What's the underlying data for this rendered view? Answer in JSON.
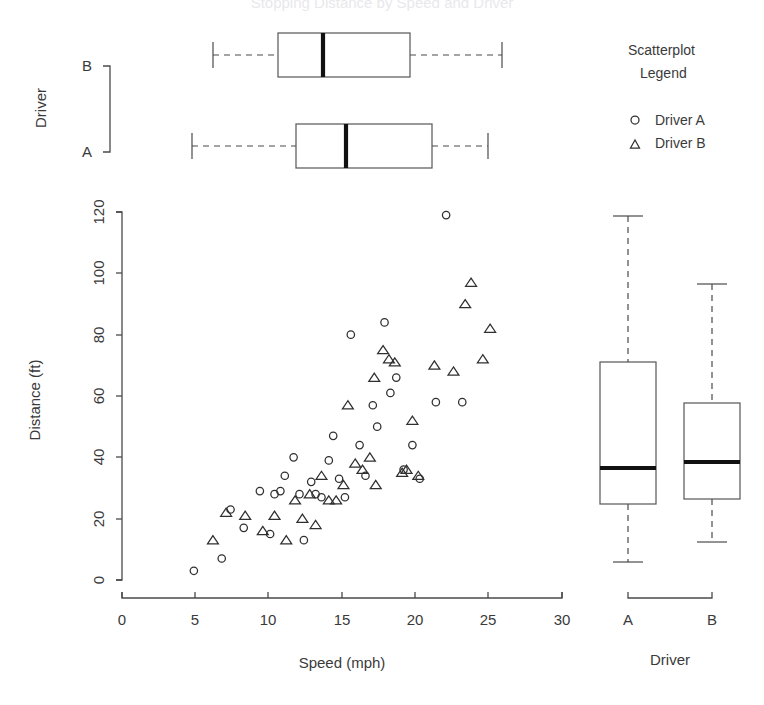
{
  "figure": {
    "clipped_title": "Stopping Distance by Speed and Driver"
  },
  "legend": {
    "title_line1": "Scatterplot",
    "title_line2": "Legend",
    "entries": [
      {
        "marker": "circle",
        "label": "Driver A"
      },
      {
        "marker": "triangle",
        "label": "Driver B"
      }
    ]
  },
  "top_panel": {
    "axis_title": "Driver",
    "category_labels": [
      "B",
      "A"
    ]
  },
  "main_panel": {
    "xlabel": "Speed (mph)",
    "ylabel": "Distance (ft)",
    "xticks": [
      0,
      5,
      10,
      15,
      20,
      25,
      30
    ],
    "yticks": [
      0,
      20,
      40,
      60,
      80,
      100,
      120
    ]
  },
  "right_panel": {
    "axis_title": "Driver",
    "category_labels": [
      "A",
      "B"
    ]
  },
  "chart_data": {
    "type": "scatter",
    "title": "Stopping Distance by Speed and Driver",
    "xlabel": "Speed (mph)",
    "ylabel": "Distance (ft)",
    "xlim": [
      0,
      30
    ],
    "ylim": [
      0,
      125
    ],
    "grid": false,
    "legend_position": "top-right",
    "legend_title": "Scatterplot Legend",
    "series": [
      {
        "name": "Driver A",
        "marker": "circle",
        "points": [
          [
            4.9,
            3
          ],
          [
            6.8,
            7
          ],
          [
            7.4,
            23
          ],
          [
            8.3,
            17
          ],
          [
            9.4,
            29
          ],
          [
            10.1,
            15
          ],
          [
            10.4,
            28
          ],
          [
            10.8,
            29
          ],
          [
            11.1,
            34
          ],
          [
            11.7,
            40
          ],
          [
            12.1,
            28
          ],
          [
            12.4,
            13
          ],
          [
            12.9,
            32
          ],
          [
            13.2,
            28
          ],
          [
            13.6,
            27
          ],
          [
            14.1,
            39
          ],
          [
            14.4,
            47
          ],
          [
            14.8,
            33
          ],
          [
            15.2,
            27
          ],
          [
            15.6,
            80
          ],
          [
            16.2,
            44
          ],
          [
            16.6,
            34
          ],
          [
            17.1,
            57
          ],
          [
            17.4,
            50
          ],
          [
            17.9,
            84
          ],
          [
            18.3,
            61
          ],
          [
            18.7,
            66
          ],
          [
            19.2,
            36
          ],
          [
            19.8,
            44
          ],
          [
            20.3,
            33
          ],
          [
            21.4,
            58
          ],
          [
            22.1,
            119
          ],
          [
            23.2,
            58
          ]
        ]
      },
      {
        "name": "Driver B",
        "marker": "triangle",
        "points": [
          [
            6.2,
            13
          ],
          [
            7.1,
            22
          ],
          [
            8.4,
            21
          ],
          [
            9.6,
            16
          ],
          [
            10.4,
            21
          ],
          [
            11.2,
            13
          ],
          [
            11.8,
            26
          ],
          [
            12.3,
            20
          ],
          [
            12.8,
            28
          ],
          [
            13.2,
            18
          ],
          [
            13.6,
            34
          ],
          [
            14.1,
            26
          ],
          [
            14.6,
            26
          ],
          [
            15.1,
            31
          ],
          [
            15.4,
            57
          ],
          [
            15.9,
            38
          ],
          [
            16.4,
            36
          ],
          [
            16.9,
            40
          ],
          [
            17.3,
            31
          ],
          [
            17.8,
            75
          ],
          [
            18.2,
            72
          ],
          [
            18.6,
            71
          ],
          [
            19.1,
            35
          ],
          [
            19.4,
            36
          ],
          [
            19.8,
            52
          ],
          [
            20.2,
            34
          ],
          [
            21.3,
            70
          ],
          [
            22.6,
            68
          ],
          [
            23.4,
            90
          ],
          [
            23.8,
            97
          ],
          [
            24.6,
            72
          ],
          [
            25.1,
            82
          ],
          [
            17.2,
            66
          ]
        ]
      }
    ],
    "marginal_boxplots": {
      "top_horizontal": {
        "orientation": "horizontal",
        "value_axis": "Speed (mph)",
        "group_axis": "Driver",
        "boxes": [
          {
            "group": "B",
            "min": 6.2,
            "q1": 14.1,
            "median": 17.2,
            "q3": 20.8,
            "max": 25.1
          },
          {
            "group": "A",
            "min": 4.9,
            "q1": 12.1,
            "median": 15.4,
            "q3": 19.4,
            "max": 23.2
          }
        ]
      },
      "right_vertical": {
        "orientation": "vertical",
        "value_axis": "Distance (ft)",
        "group_axis": "Driver",
        "boxes": [
          {
            "group": "A",
            "min": 3,
            "q1": 25,
            "median": 37,
            "q3": 71,
            "max": 119
          },
          {
            "group": "B",
            "min": 13,
            "q1": 27,
            "median": 38,
            "q3": 58,
            "max": 97
          }
        ]
      }
    }
  }
}
